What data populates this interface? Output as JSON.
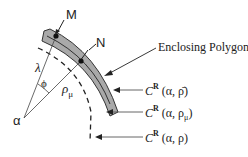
{
  "diagram": {
    "points": {
      "M": "M",
      "N": "N",
      "alpha": "α"
    },
    "angles": {
      "lambda": "λ",
      "phi": "ϕ"
    },
    "radius_label": {
      "base": "ρ",
      "sub": "μ"
    },
    "callouts": {
      "enclosing_polygon": "Enclosing Polygon",
      "curve_bar": {
        "c": "C",
        "sup": "R",
        "args": "(α, ρ̄)"
      },
      "curve_mu": {
        "c": "C",
        "sup": "R",
        "args_pre": "(α, ρ",
        "args_sub": "μ",
        "args_post": ")"
      },
      "curve_rho": {
        "c": "C",
        "sup": "R",
        "args": "(α, ρ)"
      }
    },
    "colors": {
      "band_fill": "#a9a9a9",
      "line": "#222222"
    }
  }
}
